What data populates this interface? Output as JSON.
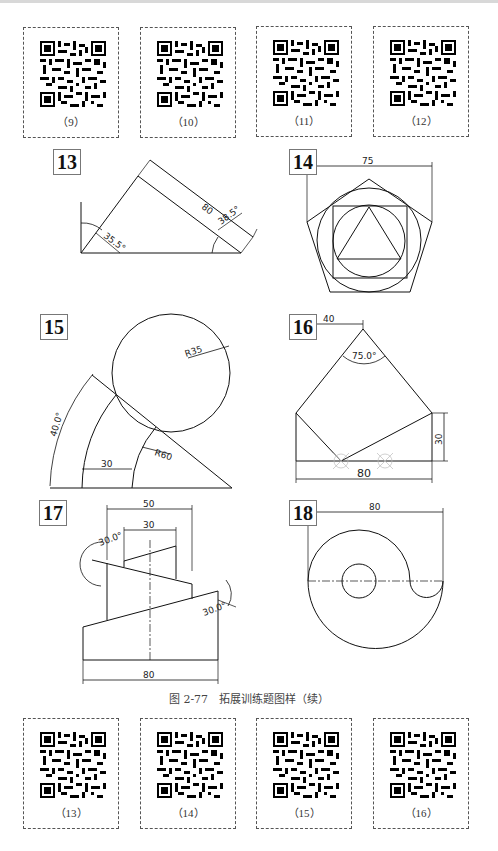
{
  "qr_row_top": {
    "cards": [
      {
        "label": "（9）"
      },
      {
        "label": "（10）"
      },
      {
        "label": "（11）"
      },
      {
        "label": "（12）"
      }
    ]
  },
  "figures": [
    {
      "number": "13",
      "dimensions": {
        "length": "80",
        "angle_left": "35.5°",
        "angle_right": "38.5°"
      }
    },
    {
      "number": "14",
      "dimensions": {
        "width": "75"
      }
    },
    {
      "number": "15",
      "dimensions": {
        "circle_radius": "R35",
        "arc_radius": "R60",
        "gap": "30",
        "angle": "40.0°"
      }
    },
    {
      "number": "16",
      "dimensions": {
        "apex_offset": "40",
        "apex_angle": "75.0°",
        "height": "30",
        "width": "80"
      }
    },
    {
      "number": "17",
      "dimensions": {
        "top_width_outer": "50",
        "top_width_inner": "30",
        "angle_left": "30.0°",
        "angle_right": "30.0°",
        "base_width": "80"
      }
    },
    {
      "number": "18",
      "dimensions": {
        "width": "80"
      }
    }
  ],
  "caption": "图 2-77　拓展训练题图样（续）",
  "qr_row_bottom": {
    "cards": [
      {
        "label": "（13）"
      },
      {
        "label": "（14）"
      },
      {
        "label": "（15）"
      },
      {
        "label": "（16）"
      }
    ]
  }
}
